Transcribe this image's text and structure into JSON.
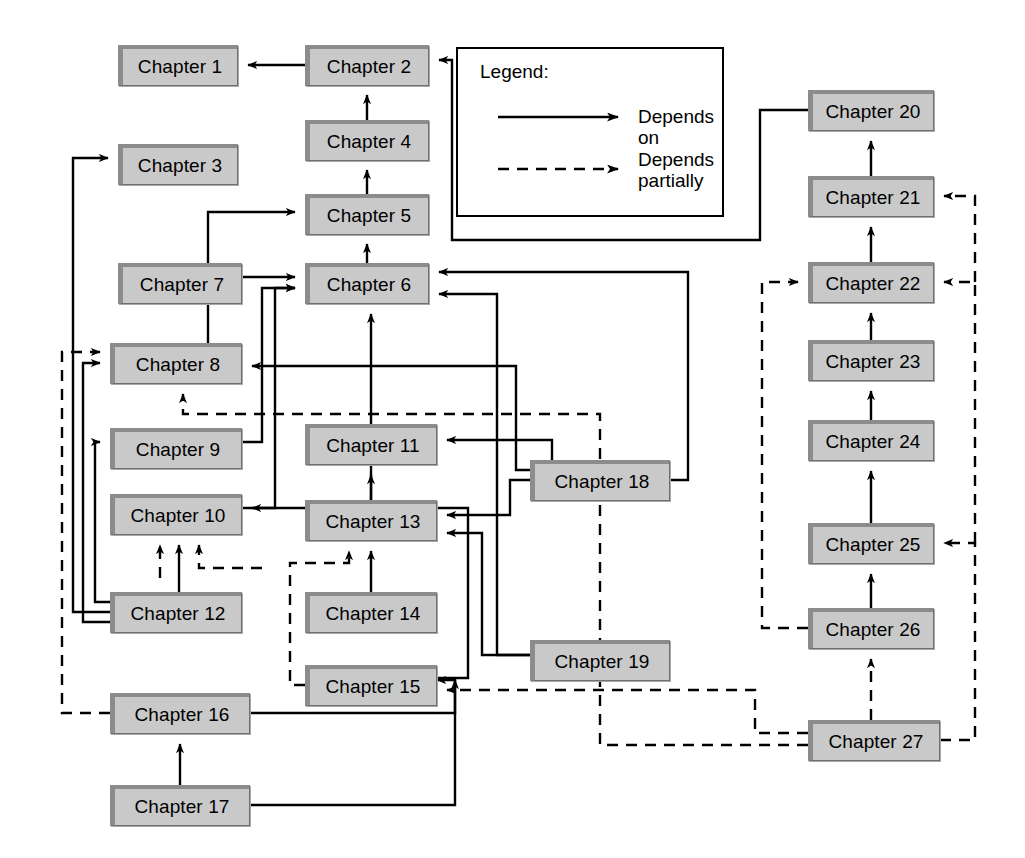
{
  "diagram": {
    "box_fill": "#c9c9c9",
    "box_edge": "#8c8c8c",
    "line_color": "#000000",
    "background": "#ffffff"
  },
  "legend": {
    "title": "Legend:",
    "entries": [
      {
        "style": "solid",
        "label": "Depends on"
      },
      {
        "style": "dashed",
        "label_line1": "Depends",
        "label_line2": "partially"
      }
    ]
  },
  "nodes": [
    {
      "id": "ch1",
      "label": "Chapter 1",
      "x": 118,
      "y": 45,
      "w": 120,
      "h": 41
    },
    {
      "id": "ch2",
      "label": "Chapter 2",
      "x": 305,
      "y": 45,
      "w": 124,
      "h": 41
    },
    {
      "id": "ch3",
      "label": "Chapter 3",
      "x": 118,
      "y": 144,
      "w": 120,
      "h": 41
    },
    {
      "id": "ch4",
      "label": "Chapter 4",
      "x": 305,
      "y": 120,
      "w": 124,
      "h": 41
    },
    {
      "id": "ch5",
      "label": "Chapter 5",
      "x": 305,
      "y": 194,
      "w": 124,
      "h": 41
    },
    {
      "id": "ch6",
      "label": "Chapter 6",
      "x": 305,
      "y": 263,
      "w": 124,
      "h": 41
    },
    {
      "id": "ch7",
      "label": "Chapter 7",
      "x": 118,
      "y": 263,
      "w": 124,
      "h": 41
    },
    {
      "id": "ch8",
      "label": "Chapter 8",
      "x": 110,
      "y": 343,
      "w": 132,
      "h": 41
    },
    {
      "id": "ch9",
      "label": "Chapter 9",
      "x": 110,
      "y": 428,
      "w": 132,
      "h": 41
    },
    {
      "id": "ch10",
      "label": "Chapter 10",
      "x": 110,
      "y": 494,
      "w": 132,
      "h": 41
    },
    {
      "id": "ch11",
      "label": "Chapter 11",
      "x": 305,
      "y": 424,
      "w": 132,
      "h": 41
    },
    {
      "id": "ch12",
      "label": "Chapter 12",
      "x": 110,
      "y": 592,
      "w": 132,
      "h": 41
    },
    {
      "id": "ch13",
      "label": "Chapter 13",
      "x": 305,
      "y": 500,
      "w": 132,
      "h": 41
    },
    {
      "id": "ch14",
      "label": "Chapter 14",
      "x": 305,
      "y": 592,
      "w": 132,
      "h": 41
    },
    {
      "id": "ch15",
      "label": "Chapter 15",
      "x": 305,
      "y": 665,
      "w": 132,
      "h": 41
    },
    {
      "id": "ch16",
      "label": "Chapter 16",
      "x": 110,
      "y": 693,
      "w": 140,
      "h": 41
    },
    {
      "id": "ch17",
      "label": "Chapter 17",
      "x": 110,
      "y": 785,
      "w": 140,
      "h": 41
    },
    {
      "id": "ch18",
      "label": "Chapter 18",
      "x": 530,
      "y": 460,
      "w": 140,
      "h": 41
    },
    {
      "id": "ch19",
      "label": "Chapter 19",
      "x": 530,
      "y": 640,
      "w": 140,
      "h": 41
    },
    {
      "id": "ch20",
      "label": "Chapter 20",
      "x": 808,
      "y": 90,
      "w": 126,
      "h": 41
    },
    {
      "id": "ch21",
      "label": "Chapter 21",
      "x": 808,
      "y": 176,
      "w": 126,
      "h": 41
    },
    {
      "id": "ch22",
      "label": "Chapter 22",
      "x": 808,
      "y": 262,
      "w": 126,
      "h": 41
    },
    {
      "id": "ch23",
      "label": "Chapter 23",
      "x": 808,
      "y": 340,
      "w": 126,
      "h": 41
    },
    {
      "id": "ch24",
      "label": "Chapter 24",
      "x": 808,
      "y": 420,
      "w": 126,
      "h": 41
    },
    {
      "id": "ch25",
      "label": "Chapter 25",
      "x": 808,
      "y": 523,
      "w": 126,
      "h": 41
    },
    {
      "id": "ch26",
      "label": "Chapter 26",
      "x": 808,
      "y": 608,
      "w": 126,
      "h": 41
    },
    {
      "id": "ch27",
      "label": "Chapter 27",
      "x": 808,
      "y": 720,
      "w": 132,
      "h": 41
    }
  ],
  "legend_box": {
    "x": 456,
    "y": 47,
    "w": 268,
    "h": 170
  },
  "edges": [
    {
      "from": "ch2",
      "to": "ch1",
      "style": "solid"
    },
    {
      "from": "ch4",
      "to": "ch2",
      "style": "solid"
    },
    {
      "from": "ch5",
      "to": "ch4",
      "style": "solid"
    },
    {
      "from": "ch6",
      "to": "ch5",
      "style": "solid"
    },
    {
      "from": "ch8",
      "to": "ch5",
      "style": "solid"
    },
    {
      "from": "ch7",
      "to": "ch6",
      "style": "solid"
    },
    {
      "from": "ch9",
      "to": "ch6",
      "style": "solid"
    },
    {
      "from": "ch10",
      "to": "ch6",
      "style": "solid"
    },
    {
      "from": "ch13",
      "to": "ch6",
      "style": "solid"
    },
    {
      "from": "ch18",
      "to": "ch6",
      "style": "solid"
    },
    {
      "from": "ch19",
      "to": "ch6",
      "style": "solid"
    },
    {
      "from": "ch12",
      "to": "ch3",
      "style": "solid"
    },
    {
      "from": "ch12",
      "to": "ch8",
      "style": "solid"
    },
    {
      "from": "ch12",
      "to": "ch9",
      "style": "solid"
    },
    {
      "from": "ch12",
      "to": "ch10",
      "style": "solid"
    },
    {
      "from": "ch12",
      "to": "ch10",
      "style": "dashed"
    },
    {
      "from": "ch16",
      "to": "ch8",
      "style": "dashed"
    },
    {
      "from": "ch18",
      "to": "ch8",
      "style": "solid"
    },
    {
      "from": "ch27",
      "to": "ch8",
      "style": "dashed"
    },
    {
      "from": "ch13",
      "to": "ch11",
      "style": "solid"
    },
    {
      "from": "ch18",
      "to": "ch11",
      "style": "solid"
    },
    {
      "from": "ch14",
      "to": "ch13",
      "style": "solid"
    },
    {
      "from": "ch15",
      "to": "ch13",
      "style": "dashed"
    },
    {
      "from": "ch18",
      "to": "ch13",
      "style": "solid"
    },
    {
      "from": "ch19",
      "to": "ch13",
      "style": "solid"
    },
    {
      "from": "ch15",
      "to": "ch10",
      "style": "solid"
    },
    {
      "from": "ch17",
      "to": "ch16",
      "style": "solid"
    },
    {
      "from": "ch16",
      "to": "ch15",
      "style": "solid"
    },
    {
      "from": "ch17",
      "to": "ch15",
      "style": "solid"
    },
    {
      "from": "ch27",
      "to": "ch15",
      "style": "dashed"
    },
    {
      "from": "ch20",
      "to": "ch2",
      "style": "solid"
    },
    {
      "from": "ch21",
      "to": "ch20",
      "style": "solid"
    },
    {
      "from": "ch22",
      "to": "ch21",
      "style": "solid"
    },
    {
      "from": "ch23",
      "to": "ch22",
      "style": "solid"
    },
    {
      "from": "ch24",
      "to": "ch23",
      "style": "solid"
    },
    {
      "from": "ch25",
      "to": "ch24",
      "style": "solid"
    },
    {
      "from": "ch26",
      "to": "ch25",
      "style": "solid"
    },
    {
      "from": "ch27",
      "to": "ch26",
      "style": "dashed"
    },
    {
      "from": "ch27",
      "to": "ch21",
      "style": "dashed"
    },
    {
      "from": "ch27",
      "to": "ch22",
      "style": "dashed"
    },
    {
      "from": "ch27",
      "to": "ch25",
      "style": "dashed"
    },
    {
      "from": "ch26",
      "to": "ch22",
      "style": "dashed"
    }
  ]
}
